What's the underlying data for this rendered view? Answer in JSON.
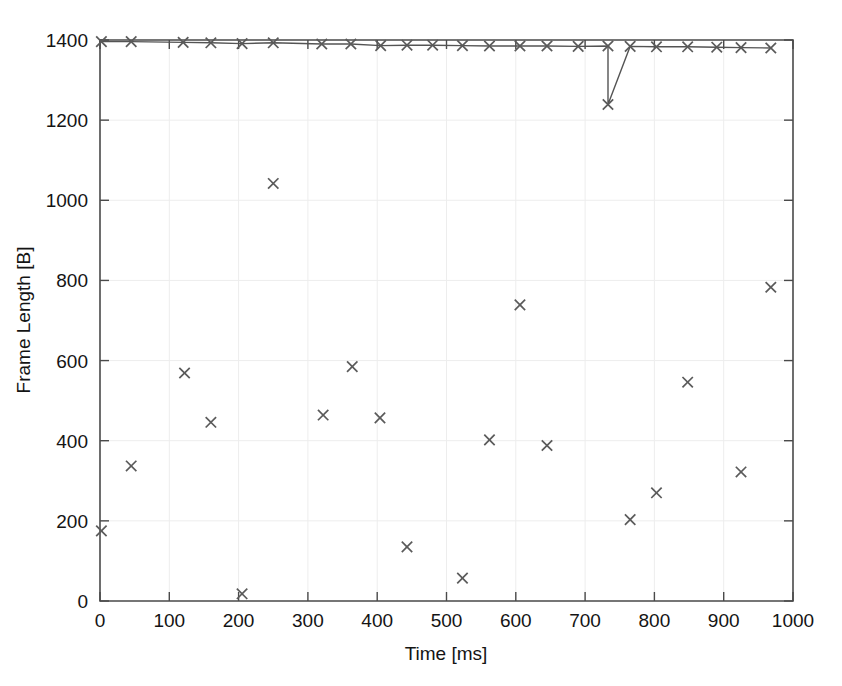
{
  "figure": {
    "title": "",
    "background_color": "#ffffff",
    "marker_color": "#5a5a5a",
    "axis_color": "#4a4a4a",
    "grid_color": "#ededed"
  },
  "axes": {
    "x": {
      "label": "Time [ms]",
      "min": 0,
      "max": 1000,
      "tick_labels": [
        "0",
        "100",
        "200",
        "300",
        "400",
        "500",
        "600",
        "700",
        "800",
        "900",
        "1000"
      ],
      "tick_values": [
        0,
        100,
        200,
        300,
        400,
        500,
        600,
        700,
        800,
        900,
        1000
      ]
    },
    "y": {
      "label": "Frame Length [B]",
      "min": 0,
      "max": 1400,
      "tick_labels": [
        "0",
        "200",
        "400",
        "600",
        "800",
        "1000",
        "1200",
        "1400"
      ],
      "tick_values": [
        0,
        200,
        400,
        600,
        800,
        1000,
        1200,
        1400
      ]
    }
  },
  "chart_data": {
    "type": "scatter",
    "title": "",
    "xlabel": "Time [ms]",
    "ylabel": "Frame Length [B]",
    "xlim": [
      0,
      1000
    ],
    "ylim": [
      0,
      1400
    ],
    "grid": true,
    "legend": null,
    "marker": "x",
    "series": [
      {
        "name": "Frame Length",
        "points": [
          [
            2,
            1396
          ],
          [
            45,
            1396
          ],
          [
            120,
            1394
          ],
          [
            160,
            1393
          ],
          [
            205,
            1391
          ],
          [
            250,
            1393
          ],
          [
            320,
            1390
          ],
          [
            362,
            1390
          ],
          [
            405,
            1386
          ],
          [
            443,
            1387
          ],
          [
            480,
            1387
          ],
          [
            523,
            1386
          ],
          [
            562,
            1385
          ],
          [
            606,
            1385
          ],
          [
            645,
            1385
          ],
          [
            690,
            1384
          ],
          [
            733,
            1385
          ],
          [
            765,
            1384
          ],
          [
            803,
            1383
          ],
          [
            848,
            1383
          ],
          [
            890,
            1382
          ],
          [
            925,
            1381
          ],
          [
            968,
            1380
          ],
          [
            2,
            175
          ],
          [
            45,
            337
          ],
          [
            122,
            569
          ],
          [
            160,
            446
          ],
          [
            205,
            18
          ],
          [
            250,
            1042
          ],
          [
            322,
            464
          ],
          [
            364,
            585
          ],
          [
            404,
            457
          ],
          [
            443,
            135
          ],
          [
            523,
            57
          ],
          [
            562,
            402
          ],
          [
            606,
            739
          ],
          [
            645,
            388
          ],
          [
            733,
            1239
          ],
          [
            765,
            203
          ],
          [
            803,
            270
          ],
          [
            848,
            546
          ],
          [
            925,
            322
          ],
          [
            968,
            783
          ]
        ]
      }
    ]
  },
  "plot_geometry": {
    "left_px": 100,
    "right_px": 793,
    "bottom_px": 601,
    "top_px": 40
  }
}
